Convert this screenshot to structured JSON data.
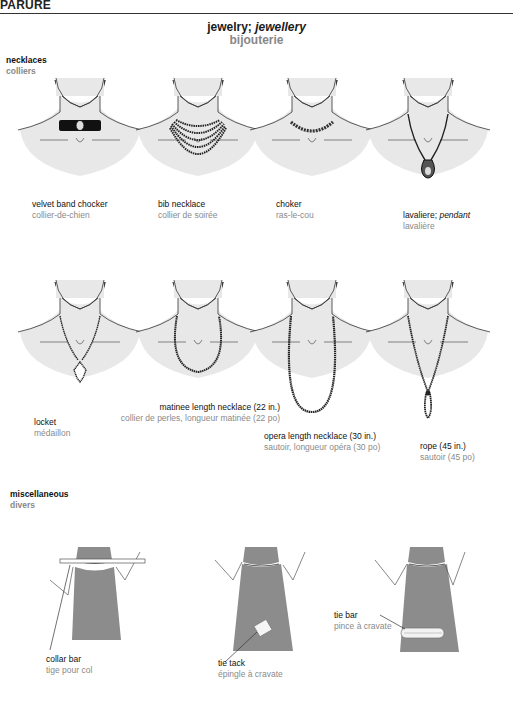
{
  "header": {
    "title": "PARURE"
  },
  "page": {
    "title_en": "jewelry;",
    "title_en_alt": "jewellery",
    "title_fr": "bijouterie"
  },
  "sections": {
    "necklaces": {
      "en": "necklaces",
      "fr": "colliers",
      "items": [
        {
          "en": "velvet band chocker",
          "fr": "collier-de-chien"
        },
        {
          "en": "bib necklace",
          "fr": "collier de soirée"
        },
        {
          "en": "choker",
          "fr": "ras-le-cou"
        },
        {
          "en": "lavaliere;",
          "en_alt": "pendant",
          "fr": "lavalière"
        },
        {
          "en": "locket",
          "fr": "médaillon"
        },
        {
          "en": "matinee length necklace (22 in.)",
          "fr": "collier de perles, longueur matinée (22 po)"
        },
        {
          "en": "opera length necklace (30 in.)",
          "fr": "sautoir, longueur opéra (30 po)"
        },
        {
          "en": "rope (45 in.)",
          "fr": "sautoir (45 po)"
        }
      ]
    },
    "miscellaneous": {
      "en": "miscellaneous",
      "fr": "divers",
      "items": [
        {
          "en": "collar bar",
          "fr": "tige pour col"
        },
        {
          "en": "tie tack",
          "fr": "épingle à cravate"
        },
        {
          "en": "tie bar",
          "fr": "pince à cravate"
        }
      ]
    }
  },
  "colors": {
    "skin": "#e8e8e8",
    "tie": "#8c8c8c",
    "jewel": "#222222",
    "french_text": "#8a8a8a"
  }
}
